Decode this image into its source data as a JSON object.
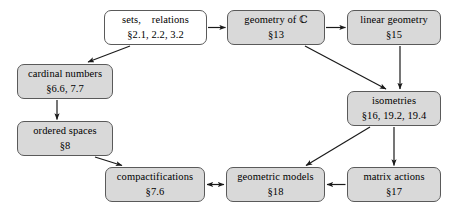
{
  "diagram": {
    "style": {
      "box_fill_gray": "#d9d9d9",
      "box_fill_white": "#ffffff",
      "box_border": "#5a5a5a",
      "arrow_color": "#1a1a1a",
      "background": "#ffffff"
    },
    "nodes": [
      {
        "id": "sets-relations",
        "label": "sets,    relations",
        "sections": "§2.1, 2.2, 3.2",
        "fill": "white",
        "x": 104,
        "y": 10,
        "w": 103,
        "h": 35
      },
      {
        "id": "geometry-of-c",
        "label": "geometry of ℂ",
        "sections": "§13",
        "fill": "gray",
        "x": 227,
        "y": 10,
        "w": 98,
        "h": 35
      },
      {
        "id": "linear-geometry",
        "label": "linear geometry",
        "sections": "§15",
        "fill": "gray",
        "x": 347,
        "y": 10,
        "w": 94,
        "h": 35
      },
      {
        "id": "cardinal-numbers",
        "label": "cardinal numbers",
        "sections": "§6.6, 7.7",
        "fill": "gray",
        "x": 17,
        "y": 64,
        "w": 96,
        "h": 35
      },
      {
        "id": "isometries",
        "label": "isometries",
        "sections": "§16, 19.2, 19.4",
        "fill": "gray",
        "x": 347,
        "y": 91,
        "w": 94,
        "h": 35
      },
      {
        "id": "ordered-spaces",
        "label": "ordered spaces",
        "sections": "§8",
        "fill": "gray",
        "x": 17,
        "y": 121,
        "w": 96,
        "h": 35
      },
      {
        "id": "compactifications",
        "label": "compactifications",
        "sections": "§7.6",
        "fill": "gray",
        "x": 105,
        "y": 167,
        "w": 100,
        "h": 35
      },
      {
        "id": "geometric-models",
        "label": "geometric models",
        "sections": "§18",
        "fill": "gray",
        "x": 226,
        "y": 167,
        "w": 99,
        "h": 35
      },
      {
        "id": "matrix-actions",
        "label": "matrix actions",
        "sections": "§17",
        "fill": "gray",
        "x": 347,
        "y": 167,
        "w": 94,
        "h": 35
      }
    ],
    "edges": [
      {
        "id": "sets-to-geometry",
        "from": "sets-relations",
        "to": "geometry-of-c",
        "kind": "single"
      },
      {
        "id": "geometry-to-linear",
        "from": "geometry-of-c",
        "to": "linear-geometry",
        "kind": "single"
      },
      {
        "id": "sets-to-cardinal",
        "from": "sets-relations",
        "to": "cardinal-numbers",
        "kind": "single"
      },
      {
        "id": "geometry-to-isometries",
        "from": "geometry-of-c",
        "to": "isometries",
        "kind": "single"
      },
      {
        "id": "linear-to-isometries",
        "from": "linear-geometry",
        "to": "isometries",
        "kind": "single"
      },
      {
        "id": "cardinal-to-ordered",
        "from": "cardinal-numbers",
        "to": "ordered-spaces",
        "kind": "single"
      },
      {
        "id": "ordered-to-compactifications",
        "from": "ordered-spaces",
        "to": "compactifications",
        "kind": "single"
      },
      {
        "id": "isometries-to-geometric-models",
        "from": "isometries",
        "to": "geometric-models",
        "kind": "single"
      },
      {
        "id": "isometries-to-matrix",
        "from": "isometries",
        "to": "matrix-actions",
        "kind": "single"
      },
      {
        "id": "matrix-to-geometric-models",
        "from": "matrix-actions",
        "to": "geometric-models",
        "kind": "single"
      },
      {
        "id": "geometric-models-to-compactifications",
        "from": "geometric-models",
        "to": "compactifications",
        "kind": "double"
      }
    ]
  }
}
